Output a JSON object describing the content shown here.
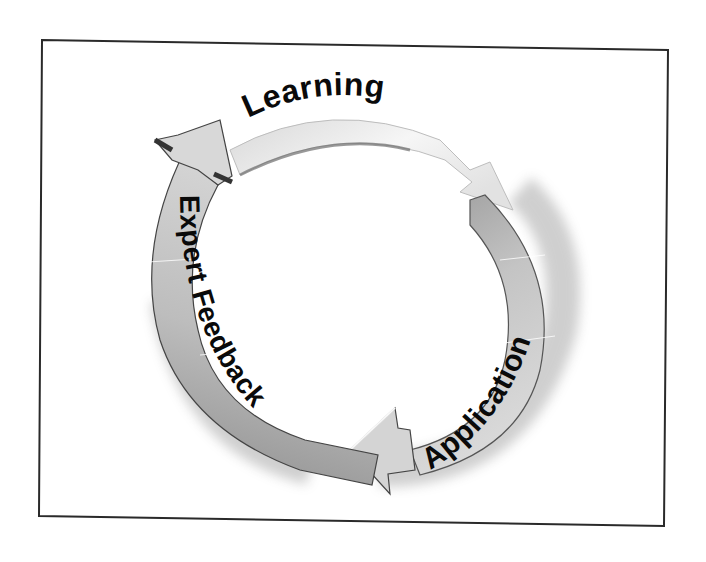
{
  "diagram": {
    "type": "cycle",
    "direction": "clockwise",
    "stages": [
      {
        "id": "learning",
        "label": "Learning"
      },
      {
        "id": "application",
        "label": "Application"
      },
      {
        "id": "expert-feedback",
        "label": "Expert Feedback"
      }
    ],
    "colors": {
      "frame": "#2a2a2a",
      "text": "#0a0a0a",
      "arrow_light": "#f4f4f4",
      "arrow_mid": "#c8c8c8",
      "arrow_dark": "#8a8a8a",
      "edge": "#3a3a3a"
    }
  }
}
